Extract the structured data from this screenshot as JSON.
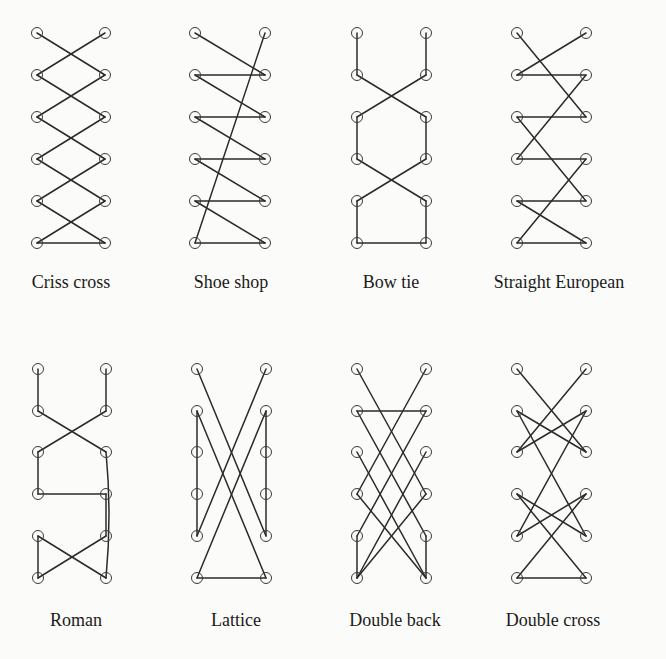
{
  "figure": {
    "eyelet_radius": 5.5,
    "rows_y": {
      "top": [
        33,
        75,
        117,
        159,
        201,
        243
      ],
      "bottom": [
        369,
        411,
        452,
        494,
        536,
        578
      ]
    },
    "label_y": {
      "top": 283,
      "bottom": 621
    },
    "diagrams": [
      {
        "name": "Criss cross",
        "row": "top",
        "xl": 37,
        "xr": 105,
        "lines": [
          [
            "L1",
            "R2"
          ],
          [
            "R1",
            "L2"
          ],
          [
            "L2",
            "R3"
          ],
          [
            "R2",
            "L3"
          ],
          [
            "L3",
            "R4"
          ],
          [
            "R3",
            "L4"
          ],
          [
            "L4",
            "R5"
          ],
          [
            "R4",
            "L5"
          ],
          [
            "L5",
            "R6"
          ],
          [
            "R5",
            "L6"
          ],
          [
            "L6",
            "R6"
          ]
        ]
      },
      {
        "name": "Shoe shop",
        "row": "top",
        "xl": 195,
        "xr": 265,
        "lines": [
          [
            "L1",
            "R2"
          ],
          [
            "R2",
            "L2"
          ],
          [
            "L2",
            "R3"
          ],
          [
            "R3",
            "L3"
          ],
          [
            "L3",
            "R4"
          ],
          [
            "R4",
            "L4"
          ],
          [
            "L4",
            "R5"
          ],
          [
            "R5",
            "L5"
          ],
          [
            "L5",
            "R6"
          ],
          [
            "R6",
            "L6"
          ],
          [
            "L6",
            "R1"
          ]
        ]
      },
      {
        "name": "Bow tie",
        "row": "top",
        "xl": 357,
        "xr": 426,
        "lines": [
          [
            "L1",
            "L2"
          ],
          [
            "R1",
            "R2"
          ],
          [
            "L2",
            "R3"
          ],
          [
            "R2",
            "L3"
          ],
          [
            "L3",
            "L4"
          ],
          [
            "R3",
            "R4"
          ],
          [
            "L4",
            "R5"
          ],
          [
            "R4",
            "L5"
          ],
          [
            "L5",
            "L6"
          ],
          [
            "R5",
            "R6"
          ],
          [
            "L6",
            "R6"
          ]
        ]
      },
      {
        "name": "Straight European",
        "row": "top",
        "xl": 517,
        "xr": 586,
        "lines": [
          [
            "L1",
            "R3"
          ],
          [
            "R1",
            "L2"
          ],
          [
            "L2",
            "R2"
          ],
          [
            "R2",
            "L4"
          ],
          [
            "L3",
            "R3"
          ],
          [
            "L3",
            "R5"
          ],
          [
            "L4",
            "R4"
          ],
          [
            "R4",
            "L6"
          ],
          [
            "L5",
            "R5"
          ],
          [
            "L5",
            "R6"
          ],
          [
            "L6",
            "R6"
          ]
        ]
      },
      {
        "name": "Roman",
        "row": "bottom",
        "xl": 38,
        "xr": 106,
        "lines": [
          [
            "L1",
            "L2"
          ],
          [
            "R1",
            "R2"
          ],
          [
            "L2",
            "R3"
          ],
          [
            "R2",
            "L3"
          ],
          [
            "L3",
            "L4"
          ],
          [
            "L4",
            "R4"
          ],
          [
            "R4",
            "R5"
          ],
          [
            "R5",
            "L6"
          ],
          [
            "L5",
            "R6"
          ],
          [
            "L5",
            "L6"
          ]
        ],
        "curves": [
          [
            "R3",
            "R6"
          ]
        ]
      },
      {
        "name": "Lattice",
        "row": "bottom",
        "xl": 197,
        "xr": 266,
        "lines": [
          [
            "L1",
            "R5"
          ],
          [
            "R1",
            "L5"
          ],
          [
            "L2",
            "L5"
          ],
          [
            "R2",
            "R5"
          ],
          [
            "L2",
            "R6"
          ],
          [
            "R2",
            "L6"
          ],
          [
            "L6",
            "R6"
          ]
        ]
      },
      {
        "name": "Double back",
        "row": "bottom",
        "xl": 357,
        "xr": 426,
        "lines": [
          [
            "L1",
            "R4"
          ],
          [
            "R1",
            "L4"
          ],
          [
            "L2",
            "R2"
          ],
          [
            "L2",
            "R5"
          ],
          [
            "R2",
            "L5"
          ],
          [
            "L3",
            "R6"
          ],
          [
            "R3",
            "L6"
          ],
          [
            "L4",
            "R6"
          ],
          [
            "R4",
            "L6"
          ],
          [
            "L5",
            "L6"
          ],
          [
            "R5",
            "R6"
          ]
        ]
      },
      {
        "name": "Double cross",
        "row": "bottom",
        "xl": 517,
        "xr": 586,
        "lines": [
          [
            "L1",
            "R3"
          ],
          [
            "R1",
            "L3"
          ],
          [
            "L2",
            "R3"
          ],
          [
            "R2",
            "L3"
          ],
          [
            "L2",
            "R5"
          ],
          [
            "R2",
            "L5"
          ],
          [
            "L4",
            "R5"
          ],
          [
            "R4",
            "L5"
          ],
          [
            "L4",
            "R6"
          ],
          [
            "R4",
            "L6"
          ],
          [
            "L6",
            "R6"
          ]
        ]
      }
    ]
  },
  "labels": {
    "criss_cross": "Criss cross",
    "shoe_shop": "Shoe shop",
    "bow_tie": "Bow tie",
    "straight_european": "Straight European",
    "roman": "Roman",
    "lattice": "Lattice",
    "double_back": "Double back",
    "double_cross": "Double cross"
  }
}
